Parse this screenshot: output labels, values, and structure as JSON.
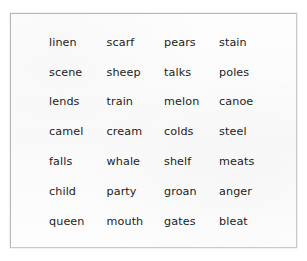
{
  "card": {
    "background_color": "#fbfbfb",
    "border_color": "#b6b6b6",
    "text_color": "#232323"
  },
  "word_list": {
    "columns": 4,
    "rows": 7,
    "grid": [
      [
        "linen",
        "scarf",
        "pears",
        "stain"
      ],
      [
        "scene",
        "sheep",
        "talks",
        "poles"
      ],
      [
        "lends",
        "train",
        "melon",
        "canoe"
      ],
      [
        "camel",
        "cream",
        "colds",
        "steel"
      ],
      [
        "falls",
        "whale",
        "shelf",
        "meats"
      ],
      [
        "child",
        "party",
        "groan",
        "anger"
      ],
      [
        "queen",
        "mouth",
        "gates",
        "bleat"
      ]
    ]
  }
}
